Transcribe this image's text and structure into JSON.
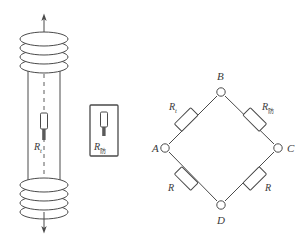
{
  "figure": {
    "stroke_color": "#4a4a4a",
    "label_color": "#3a3a3a",
    "fill_color": "#ffffff",
    "element_fill": "#7a7a7a"
  },
  "coil_device": {
    "name": "coiled-tube-with-thermistor",
    "thermistor_label": "R",
    "thermistor_subscript": "t",
    "top_arrow": "up-arrow",
    "bottom_arrow": "down-arrow",
    "top_coil_turns": 4,
    "bottom_coil_turns": 4,
    "centerline": "dashed"
  },
  "boxed_component": {
    "name": "boxed-thermistor",
    "label": "R",
    "subscript": "防"
  },
  "bridge": {
    "name": "wheatstone-bridge",
    "nodes": [
      {
        "id": "A",
        "label": "A",
        "x": 165,
        "y": 148
      },
      {
        "id": "B",
        "label": "B",
        "x": 221,
        "y": 90
      },
      {
        "id": "C",
        "label": "C",
        "x": 278,
        "y": 148
      },
      {
        "id": "D",
        "label": "D",
        "x": 221,
        "y": 206
      }
    ],
    "resistors": [
      {
        "id": "AB",
        "label": "R",
        "subscript": "t",
        "from": "A",
        "to": "B"
      },
      {
        "id": "BC",
        "label": "R",
        "subscript": "防",
        "from": "B",
        "to": "C"
      },
      {
        "id": "AD",
        "label": "R",
        "subscript": "",
        "from": "A",
        "to": "D"
      },
      {
        "id": "DC",
        "label": "R",
        "subscript": "",
        "from": "D",
        "to": "C"
      }
    ]
  }
}
